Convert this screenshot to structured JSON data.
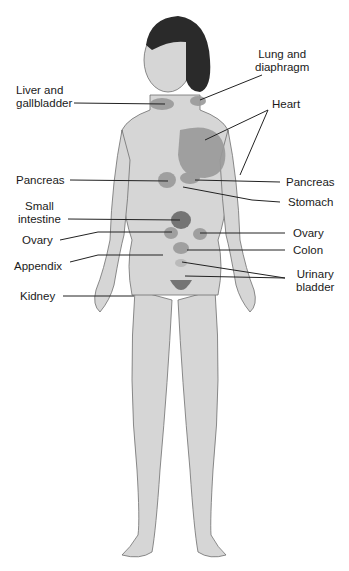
{
  "diagram": {
    "colors": {
      "skin": "#d6d6d6",
      "skin_shade": "#bfbfbf",
      "outline": "#6e6e6e",
      "hair": "#2a2a2a",
      "region": "#9a9a9a",
      "region_dark": "#6a6a6a",
      "line": "#222222"
    },
    "labels": {
      "liver": "Liver and\ngallbladder",
      "lung": "Lung and\ndiaphragm",
      "heart": "Heart",
      "pancreas_left": "Pancreas",
      "pancreas_right": "Pancreas",
      "stomach": "Stomach",
      "small_intestine": "Small\nintestine",
      "ovary_left": "Ovary",
      "ovary_right": "Ovary",
      "colon": "Colon",
      "appendix": "Appendix",
      "urinary_bladder": "Urinary\nbladder",
      "kidney": "Kidney"
    }
  }
}
